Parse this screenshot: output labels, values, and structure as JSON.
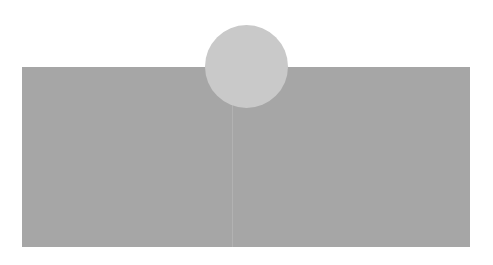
{
  "shapes": {
    "rectangle": {
      "color": "#a6a6a6"
    },
    "divider": {
      "color": "#b2b2b2"
    },
    "circle": {
      "color": "#c9c9c9"
    }
  },
  "background": "#ffffff"
}
